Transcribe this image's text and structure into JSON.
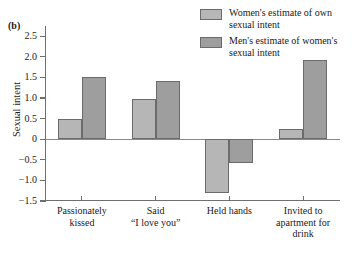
{
  "figure": {
    "panel_label": "(b)"
  },
  "legend": {
    "position": "top-right",
    "entries": [
      {
        "key": "women",
        "label": "Women's estimate of own\nsexual intent",
        "color": "#b6b6b6"
      },
      {
        "key": "men",
        "label": "Men's estimate of women's\nsexual intent",
        "color": "#9e9e9e"
      }
    ]
  },
  "axes": {
    "ylabel": "Sexual intent",
    "xlabel": "",
    "yticks": [
      "2.5",
      "2.0",
      "1.5",
      "1.0",
      "0.5",
      "0",
      "−0.5",
      "−1.0",
      "−1.5"
    ],
    "ytick_values": [
      2.5,
      2.0,
      1.5,
      1.0,
      0.5,
      0,
      -0.5,
      -1.0,
      -1.5
    ],
    "ylim": [
      -1.5,
      2.75
    ],
    "grid": false
  },
  "chart_data": {
    "type": "bar",
    "title": "",
    "subtitle": "",
    "xlabel": "",
    "ylabel": "Sexual intent",
    "ylim": [
      -1.5,
      2.75
    ],
    "grid": false,
    "legend_position": "top-right",
    "categories": [
      "Passionately\nkissed",
      "Said\n“I love you”",
      "Held hands",
      "Invited to\napartment for\ndrink"
    ],
    "series": [
      {
        "name": "Women's estimate of own sexual intent",
        "color": "#b6b6b6",
        "values": [
          0.5,
          0.97,
          -1.3,
          0.25
        ]
      },
      {
        "name": "Men's estimate of women's sexual intent",
        "color": "#9e9e9e",
        "values": [
          1.5,
          1.42,
          -0.57,
          1.92
        ]
      }
    ]
  }
}
